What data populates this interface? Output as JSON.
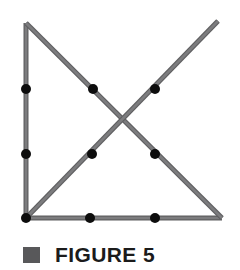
{
  "figure": {
    "caption": {
      "bullet_color": "#58585a",
      "label": "FIGURE 5"
    },
    "canvas": {
      "width": 240,
      "height": 270,
      "background": "#ffffff"
    },
    "style": {
      "line_color": "#7c7c7e",
      "line_edge_color": "#5f5f61",
      "line_width": 4,
      "dot_color": "#0d0d0d",
      "dot_radius": 5
    },
    "shape_name": "right-triangle-with-rising-diagonal",
    "segments": [
      {
        "name": "left-vertical-leg",
        "x1": 26,
        "y1": 23,
        "x2": 26,
        "y2": 218
      },
      {
        "name": "bottom-horizontal-leg",
        "x1": 26,
        "y1": 218,
        "x2": 222,
        "y2": 218
      },
      {
        "name": "hypotenuse-descending",
        "x1": 26,
        "y1": 23,
        "x2": 222,
        "y2": 218
      },
      {
        "name": "diagonal-ascending",
        "x1": 26,
        "y1": 218,
        "x2": 218,
        "y2": 21
      }
    ],
    "points": [
      {
        "name": "point-left-upper",
        "x": 26,
        "y": 89
      },
      {
        "name": "point-left-middle",
        "x": 26,
        "y": 154
      },
      {
        "name": "point-bottom-left-corner",
        "x": 26,
        "y": 218
      },
      {
        "name": "point-bottom-middle",
        "x": 90,
        "y": 218
      },
      {
        "name": "point-bottom-right-inner",
        "x": 155,
        "y": 218
      },
      {
        "name": "point-hypotenuse-upper",
        "x": 93,
        "y": 89
      },
      {
        "name": "point-hypotenuse-lower",
        "x": 155,
        "y": 154
      },
      {
        "name": "point-ascending-upper",
        "x": 155,
        "y": 89
      },
      {
        "name": "point-ascending-lower",
        "x": 92,
        "y": 154
      }
    ]
  }
}
